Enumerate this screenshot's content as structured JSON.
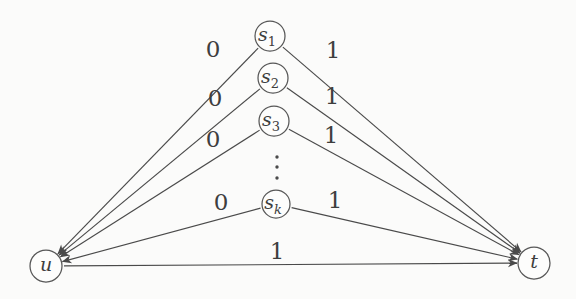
{
  "canvas": {
    "width": 576,
    "height": 299
  },
  "colors": {
    "background": "#fbfbfa",
    "line": "#4a4a4a",
    "text": "#3e3e3e",
    "node_fill": "#fdfdfc",
    "node_stroke": "#575757"
  },
  "diagram": {
    "nodes": [
      {
        "id": "s1",
        "base": "s",
        "sub": "1",
        "x": 270,
        "y": 36,
        "r": 15
      },
      {
        "id": "s2",
        "base": "s",
        "sub": "2",
        "x": 273,
        "y": 78,
        "r": 15
      },
      {
        "id": "s3",
        "base": "s",
        "sub": "3",
        "x": 274,
        "y": 121,
        "r": 15
      },
      {
        "id": "sk",
        "base": "s",
        "sub": "k",
        "x": 276,
        "y": 204,
        "r": 14
      },
      {
        "id": "u",
        "base": "u",
        "sub": "",
        "x": 46,
        "y": 266,
        "r": 16
      },
      {
        "id": "t",
        "base": "t",
        "sub": "",
        "x": 534,
        "y": 263,
        "r": 16
      }
    ],
    "edges": [
      {
        "from": "s1",
        "to": "u",
        "label": "0",
        "label_x": 213,
        "label_y": 49
      },
      {
        "from": "s1",
        "to": "t",
        "label": "1",
        "label_x": 333,
        "label_y": 50
      },
      {
        "from": "s2",
        "to": "u",
        "label": "0",
        "label_x": 215,
        "label_y": 98
      },
      {
        "from": "s2",
        "to": "t",
        "label": "1",
        "label_x": 332,
        "label_y": 96
      },
      {
        "from": "s3",
        "to": "u",
        "label": "0",
        "label_x": 213,
        "label_y": 139
      },
      {
        "from": "s3",
        "to": "t",
        "label": "1",
        "label_x": 331,
        "label_y": 135
      },
      {
        "from": "sk",
        "to": "u",
        "label": "0",
        "label_x": 221,
        "label_y": 202
      },
      {
        "from": "sk",
        "to": "t",
        "label": "1",
        "label_x": 335,
        "label_y": 200
      },
      {
        "from": "u",
        "to": "t",
        "label": "1",
        "label_x": 277,
        "label_y": 251
      }
    ],
    "ellipsis": {
      "x": 277,
      "dots_y": [
        157,
        167,
        178
      ],
      "dot_r": 1.7
    }
  }
}
